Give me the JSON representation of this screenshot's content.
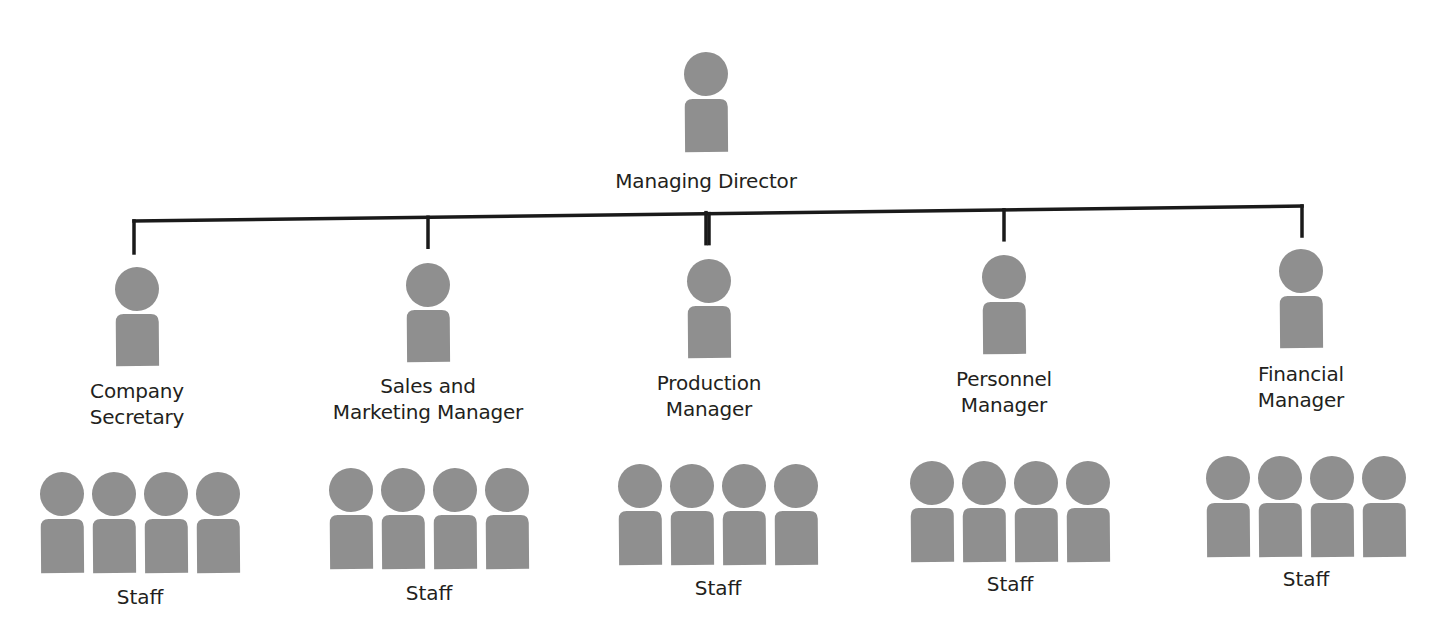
{
  "colors": {
    "figure": "#8f8f8f",
    "line": "#1a1a1a",
    "text": "#231f20",
    "background": "#ffffff"
  },
  "top": {
    "label": "Managing Director",
    "icon": "person-icon",
    "cx": 706,
    "head_cy": 74,
    "label_y": 168
  },
  "connector": {
    "x1": 134,
    "y1": 221,
    "x2": 1302,
    "y2": 206,
    "drop": 30
  },
  "managers": [
    {
      "label_lines": [
        "Company",
        "Secretary"
      ],
      "cx": 137,
      "head_cy": 289,
      "label_y": 378,
      "staff": {
        "label": "Staff",
        "count": 4,
        "cx": 140,
        "head_cy": 494,
        "label_y": 585
      }
    },
    {
      "label_lines": [
        "Sales and",
        "Marketing Manager"
      ],
      "cx": 428,
      "head_cy": 285,
      "label_y": 373,
      "staff": {
        "label": "Staff",
        "count": 4,
        "cx": 429,
        "head_cy": 490,
        "label_y": 581
      }
    },
    {
      "label_lines": [
        "Production",
        "Manager"
      ],
      "cx": 709,
      "head_cy": 281,
      "label_y": 370,
      "staff": {
        "label": "Staff",
        "count": 4,
        "cx": 718,
        "head_cy": 486,
        "label_y": 576
      }
    },
    {
      "label_lines": [
        "Personnel",
        "Manager"
      ],
      "cx": 1004,
      "head_cy": 277,
      "label_y": 366,
      "staff": {
        "label": "Staff",
        "count": 4,
        "cx": 1010,
        "head_cy": 483,
        "label_y": 572
      }
    },
    {
      "label_lines": [
        "Financial",
        "Manager"
      ],
      "cx": 1301,
      "head_cy": 271,
      "label_y": 361,
      "staff": {
        "label": "Staff",
        "count": 4,
        "cx": 1306,
        "head_cy": 478,
        "label_y": 567
      }
    }
  ]
}
